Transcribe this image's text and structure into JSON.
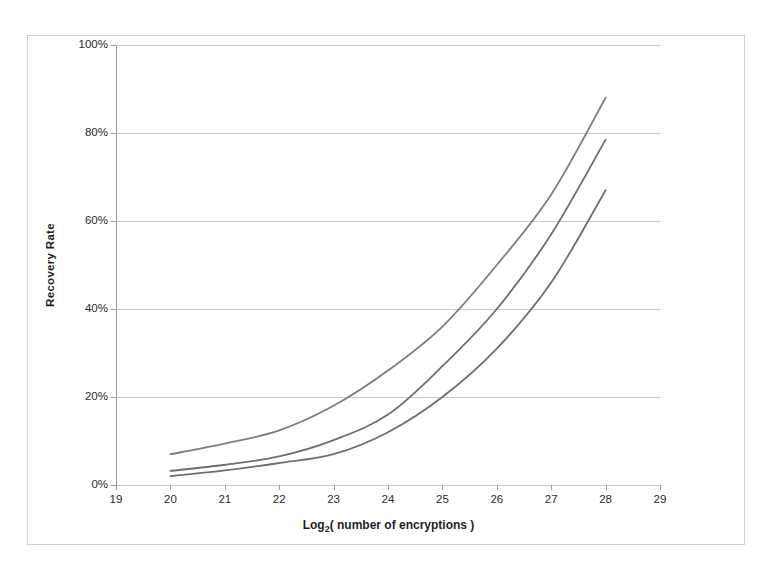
{
  "chart_data": {
    "type": "line",
    "title": "",
    "xlabel": "Log2( number of encryptions )",
    "xlabel_base": "Log",
    "xlabel_sub": "2",
    "xlabel_rest": "( number of encryptions )",
    "ylabel": "Recovery Rate",
    "xlim": [
      19,
      29
    ],
    "ylim": [
      0,
      100
    ],
    "xticks": [
      19,
      20,
      21,
      22,
      23,
      24,
      25,
      26,
      27,
      28,
      29
    ],
    "xtick_labels": [
      "19",
      "20",
      "21",
      "22",
      "23",
      "24",
      "25",
      "26",
      "27",
      "28",
      "29"
    ],
    "yticks": [
      0,
      20,
      40,
      60,
      80,
      100
    ],
    "ytick_labels": [
      "0%",
      "20%",
      "40%",
      "60%",
      "80%",
      "100%"
    ],
    "grid": "horizontal",
    "legend": "none",
    "x": [
      20,
      21,
      22,
      23,
      24,
      25,
      26,
      27,
      28
    ],
    "series": [
      {
        "name": "upper-curve",
        "color": "#7d7d7d",
        "values": [
          7.0,
          9.4,
          12.4,
          18.0,
          26.0,
          36.0,
          50.0,
          66.0,
          88.0
        ]
      },
      {
        "name": "middle-curve",
        "color": "#6e6e6e",
        "values": [
          3.2,
          4.6,
          6.5,
          10.2,
          16.0,
          27.0,
          40.0,
          57.0,
          78.5
        ]
      },
      {
        "name": "lower-curve",
        "color": "#6e6e6e",
        "values": [
          2.0,
          3.3,
          5.0,
          7.0,
          12.0,
          20.0,
          31.0,
          46.0,
          67.0
        ]
      }
    ]
  },
  "colors": {
    "frame": "#cfcfcf",
    "axis": "#9a9a9a",
    "gridline": "#c8c8c8",
    "text": "#2b2b2b",
    "background": "#ffffff"
  }
}
